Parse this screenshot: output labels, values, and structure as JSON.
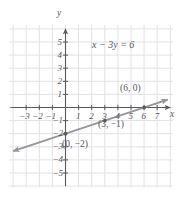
{
  "figure": {
    "kind": "coordinate-graph",
    "equation": "x − 3y = 6",
    "axis_labels": {
      "x": "x",
      "y": "y"
    },
    "colors": {
      "grid": "#e2e2e6",
      "axis": "#58585a",
      "line": "#95959a",
      "text": "#58585a",
      "background": "#ffffff"
    }
  },
  "chart_data": {
    "type": "line",
    "title": "",
    "annotations": [
      "x − 3y = 6"
    ],
    "xlabel": "x",
    "ylabel": "y",
    "xlim": [
      -4,
      8
    ],
    "ylim": [
      -6,
      6
    ],
    "grid": true,
    "legend": "none",
    "x_ticks": [
      "-3",
      "-2",
      "-1",
      "1",
      "2",
      "3",
      "4",
      "5",
      "6",
      "7"
    ],
    "x_tick_values": [
      -3,
      -2,
      -1,
      1,
      2,
      3,
      4,
      5,
      6,
      7
    ],
    "y_ticks": [
      "5",
      "4",
      "3",
      "2",
      "1",
      "-1",
      "-2",
      "-3",
      "-4",
      "-5"
    ],
    "y_tick_values": [
      5,
      4,
      3,
      2,
      1,
      -1,
      -2,
      -3,
      -4,
      -5
    ],
    "series": [
      {
        "name": "x − 3y = 6",
        "equation": "x - 3y = 6",
        "slope": 0.3333333333,
        "intercept": -2,
        "arrows": "both",
        "x_range": [
          -4.0,
          7.8
        ]
      }
    ],
    "points": [
      {
        "label": "(0, −2)",
        "x": 0,
        "y": -2
      },
      {
        "label": "(3, −1)",
        "x": 3,
        "y": -1
      },
      {
        "label": "(6, 0)",
        "x": 6,
        "y": 0
      }
    ]
  },
  "ticks": {
    "x": [
      {
        "label": "−3",
        "x": -3
      },
      {
        "label": "−2",
        "x": -2
      },
      {
        "label": "−1",
        "x": -1
      },
      {
        "label": "1",
        "x": 1
      },
      {
        "label": "2",
        "x": 2
      },
      {
        "label": "3",
        "x": 3
      },
      {
        "label": "4",
        "x": 4
      },
      {
        "label": "5",
        "x": 5
      },
      {
        "label": "6",
        "x": 6
      },
      {
        "label": "7",
        "x": 7
      }
    ],
    "y": [
      {
        "label": "5",
        "y": 5
      },
      {
        "label": "4",
        "y": 4
      },
      {
        "label": "3",
        "y": 3
      },
      {
        "label": "2",
        "y": 2
      },
      {
        "label": "1",
        "y": 1
      },
      {
        "label": "−1",
        "y": -1
      },
      {
        "label": "−2",
        "y": -2
      },
      {
        "label": "−3",
        "y": -3
      },
      {
        "label": "−4",
        "y": -4
      },
      {
        "label": "−5",
        "y": -5
      }
    ]
  },
  "point_labels": [
    {
      "text": "(6, 0)",
      "left": 120,
      "top": 84
    },
    {
      "text": "(3, −1)",
      "left": 98,
      "top": 120
    },
    {
      "text": "(0, −2)",
      "left": 62,
      "top": 140
    }
  ]
}
